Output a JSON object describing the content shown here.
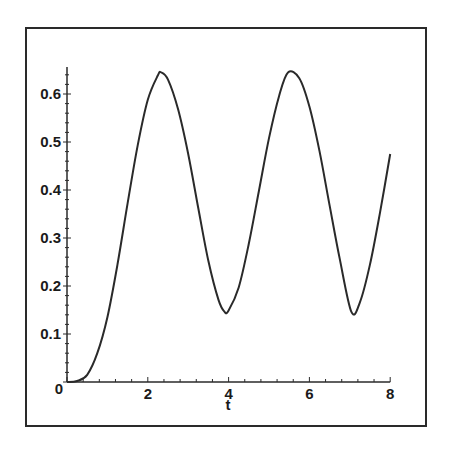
{
  "chart_data": {
    "type": "line",
    "title": "",
    "xlabel": "t",
    "ylabel": "",
    "xlim": [
      0,
      8
    ],
    "ylim": [
      0,
      0.65
    ],
    "grid": false,
    "legend": null,
    "x_ticks": [
      "0",
      "2",
      "4",
      "6",
      "8"
    ],
    "y_ticks": [
      "0.1",
      "0.2",
      "0.3",
      "0.4",
      "0.5",
      "0.6"
    ],
    "origin_label": "0",
    "series": [
      {
        "name": "curve",
        "color": "#2a2a2a",
        "x": [
          0,
          0.25,
          0.5,
          0.75,
          1.0,
          1.25,
          1.5,
          1.75,
          2.0,
          2.25,
          2.33,
          2.5,
          2.75,
          3.0,
          3.25,
          3.5,
          3.75,
          3.9,
          4.0,
          4.25,
          4.5,
          4.75,
          5.0,
          5.25,
          5.47,
          5.75,
          6.0,
          6.25,
          6.5,
          6.75,
          7.04,
          7.25,
          7.5,
          7.75,
          8.0
        ],
        "y": [
          0.0,
          0.002,
          0.015,
          0.06,
          0.135,
          0.245,
          0.372,
          0.493,
          0.588,
          0.639,
          0.645,
          0.63,
          0.568,
          0.475,
          0.362,
          0.252,
          0.171,
          0.146,
          0.149,
          0.197,
          0.288,
          0.398,
          0.508,
          0.596,
          0.645,
          0.633,
          0.574,
          0.481,
          0.368,
          0.257,
          0.146,
          0.166,
          0.245,
          0.354,
          0.475
        ]
      }
    ]
  }
}
